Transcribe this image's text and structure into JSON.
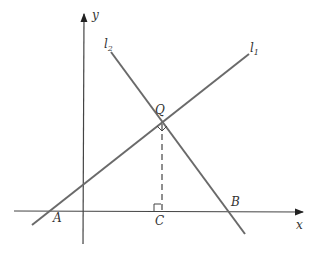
{
  "diagram": {
    "type": "geometry",
    "axes": {
      "x_label": "x",
      "y_label": "y"
    },
    "lines": [
      {
        "name": "l",
        "subscript": "1"
      },
      {
        "name": "l",
        "subscript": "2"
      }
    ],
    "points": {
      "A": "A",
      "B": "B",
      "C": "C",
      "Q": "Q"
    },
    "colors": {
      "line": "#6a6a6a",
      "axis": "#444444",
      "text": "#333333"
    }
  }
}
